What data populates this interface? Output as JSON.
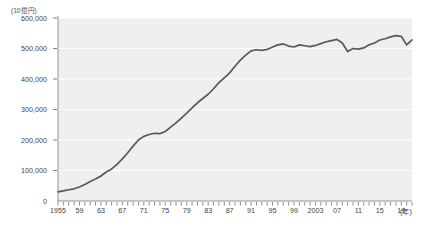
{
  "chart_data": {
    "type": "line",
    "title": "",
    "subtitle": "",
    "unit_label": "(10億円)",
    "xlabel": "(年)",
    "ylabel": "",
    "ylim": [
      0,
      600000
    ],
    "xlim": [
      1955,
      2021
    ],
    "grid": true,
    "legend": null,
    "y_ticks": [
      "0",
      "100,000",
      "200,000",
      "300,000",
      "400,000",
      "500,000",
      "600,000"
    ],
    "y_tick_values": [
      0,
      100000,
      200000,
      300000,
      400000,
      500000,
      600000
    ],
    "x_tick_labels": [
      "1955",
      "59",
      "63",
      "67",
      "71",
      "75",
      "79",
      "83",
      "87",
      "91",
      "95",
      "99",
      "2003",
      "07",
      "11",
      "15",
      "19"
    ],
    "x_tick_values": [
      1955,
      1959,
      1963,
      1967,
      1971,
      1975,
      1979,
      1983,
      1987,
      1991,
      1995,
      1999,
      2003,
      2007,
      2011,
      2015,
      2019
    ],
    "minor_tick_interval": 1,
    "line_color": "#595959",
    "plot_background": "#efefef",
    "gridline_color": "#ffffff",
    "series": [
      {
        "name": "",
        "x": [
          1955,
          1956,
          1957,
          1958,
          1959,
          1960,
          1961,
          1962,
          1963,
          1964,
          1965,
          1966,
          1967,
          1968,
          1969,
          1970,
          1971,
          1972,
          1973,
          1974,
          1975,
          1976,
          1977,
          1978,
          1979,
          1980,
          1981,
          1982,
          1983,
          1984,
          1985,
          1986,
          1987,
          1988,
          1989,
          1990,
          1991,
          1992,
          1993,
          1994,
          1995,
          1996,
          1997,
          1998,
          1999,
          2000,
          2001,
          2002,
          2003,
          2004,
          2005,
          2006,
          2007,
          2008,
          2009,
          2010,
          2011,
          2012,
          2013,
          2014,
          2015,
          2016,
          2017,
          2018,
          2019,
          2020,
          2021
        ],
        "values": [
          30000,
          33000,
          37000,
          40000,
          46000,
          54000,
          64000,
          72000,
          82000,
          95000,
          105000,
          120000,
          138000,
          158000,
          180000,
          200000,
          212000,
          218000,
          222000,
          221000,
          228000,
          242000,
          256000,
          272000,
          288000,
          305000,
          322000,
          336000,
          350000,
          368000,
          388000,
          404000,
          420000,
          442000,
          462000,
          478000,
          492000,
          496000,
          494000,
          497000,
          505000,
          512000,
          515000,
          508000,
          505000,
          512000,
          509000,
          506000,
          510000,
          516000,
          522000,
          526000,
          530000,
          518000,
          490000,
          500000,
          498000,
          502000,
          512000,
          518000,
          528000,
          532000,
          538000,
          542000,
          540000,
          512000,
          528000
        ]
      }
    ]
  }
}
